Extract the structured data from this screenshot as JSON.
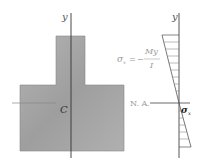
{
  "diagram": {
    "cross_section": {
      "axis_label": "y",
      "centroid_label": "C",
      "fill_color": "#a9a9a9"
    },
    "stress_diagram": {
      "axis_label": "y",
      "formula_lhs": "σ",
      "formula_lhs_sub": "x",
      "formula_eq": "=",
      "formula_sign": "−",
      "formula_numerator": "My",
      "formula_denominator": "I",
      "neutral_axis_label": "N. A.",
      "stress_label": "σ",
      "stress_label_sub": "x"
    }
  }
}
